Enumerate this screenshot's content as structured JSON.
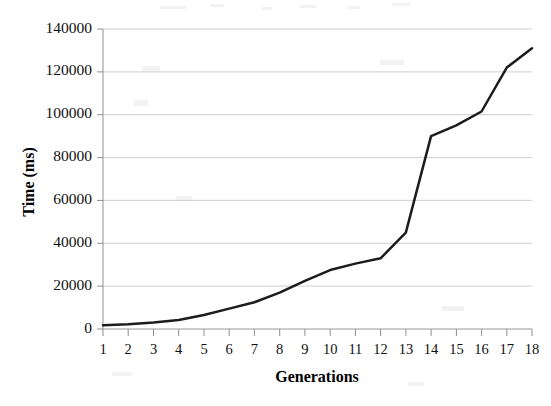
{
  "chart_data": {
    "type": "line",
    "title": "",
    "xlabel": "Generations",
    "ylabel": "Time (ms)",
    "x": [
      1,
      2,
      3,
      4,
      5,
      6,
      7,
      8,
      9,
      10,
      11,
      12,
      13,
      14,
      15,
      16,
      17,
      18
    ],
    "categories": [
      "1",
      "2",
      "3",
      "4",
      "5",
      "6",
      "7",
      "8",
      "9",
      "10",
      "11",
      "12",
      "13",
      "14",
      "15",
      "16",
      "17",
      "18"
    ],
    "values": [
      1800,
      2200,
      3000,
      4200,
      6500,
      9500,
      12500,
      17000,
      22500,
      27500,
      30500,
      33000,
      45000,
      90000,
      95000,
      101500,
      122000,
      131000
    ],
    "series": [
      {
        "name": "Time",
        "color": "#1c1c1c",
        "values": [
          1800,
          2200,
          3000,
          4200,
          6500,
          9500,
          12500,
          17000,
          22500,
          27500,
          30500,
          33000,
          45000,
          90000,
          95000,
          101500,
          122000,
          131000
        ]
      }
    ],
    "xlim": [
      1,
      18
    ],
    "ylim": [
      0,
      140000
    ],
    "yticks": [
      0,
      20000,
      40000,
      60000,
      80000,
      100000,
      120000,
      140000
    ],
    "ytick_labels": [
      "0",
      "20000",
      "40000",
      "60000",
      "80000",
      "100000",
      "120000",
      "140000"
    ],
    "grid": true,
    "grid_axis": "y",
    "legend": false,
    "legend_position": "none"
  },
  "axes": {
    "y_title": "Time (ms)",
    "x_title": "Generations"
  }
}
